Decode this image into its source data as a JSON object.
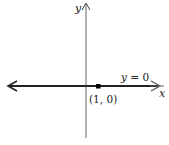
{
  "diagram": {
    "type": "coordinate-plane",
    "axes": {
      "x_label": "x",
      "y_label": "y"
    },
    "line": {
      "equation": "y = 0",
      "label_var": "y",
      "label_rest": " = 0"
    },
    "point": {
      "label": "(1, 0)",
      "x": 1,
      "y": 0
    },
    "colors": {
      "axis": "#555555",
      "line": "#222222",
      "point": "#000000"
    }
  }
}
